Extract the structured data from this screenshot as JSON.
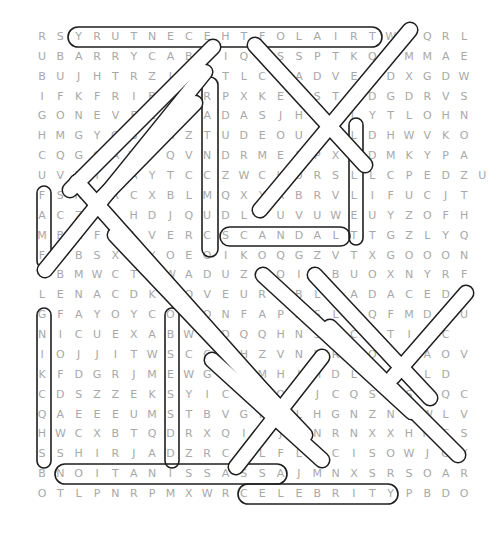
{
  "puzzle": {
    "cols": 24,
    "rows": 24,
    "origin_x": 42,
    "origin_y": 37,
    "step_x": 18.35,
    "step_y": 19.87,
    "grid": [
      "RSYRUTNECEHTFOLAIRTWBQRL",
      "UBARRYCABDIQSSSPTKQIMMAE",
      "BUJHTRZIIYTLCSADVEODXGDW",
      "IFKFRIBOERPXKEESTGDGDRVS",
      "GONEVFLHPADASJHRRLYTLOHN",
      "HMGYOBLAZTUDEOUAPLDHWVKO",
      "CQGCAWPQVNDRMEPPXADMKYPA",
      "UVHTAAYTCCZWCHURSLLCPEDZU",
      "FSNORCXBLMQXYRBRVLIFUCJT",
      "ACZALHDJQUDLFUVUWEUYZOFH",
      "MBZFLLVERCSCANDALTTGZLYQ",
      "FZBSXAYOEOIKOQGZVTXGOOON",
      "IBMWCTNWADUZNOITBUOXNYRF",
      "LENACDKOOVEUREBLSADACEDC",
      "GFAYOYCOIONFAPWSLAQFMDRU",
      "NICUEXABWTDQQHNSLCATIJC",
      "IOJJITWSCCAHZVNBRRODMAOV",
      "KFDGRJMEWGISMHIHDLAOHLD",
      "CDSZZEKSYICENOYJCQSTSPQC",
      "QAEEEUMSTBVGPELHGNZNSWLV",
      "HWCXBTQDRXQIRJSNRNXXHMCS",
      "SSHIRJADZRCPLFLTCISOWJOY",
      "BNOITANISSASSAJMNXSRSOAR",
      "OTLPNRPMXWRCELEBRITYPBDO"
    ],
    "found_words": [
      {
        "word": "YRUTNECEHTFOLAIRT",
        "from": [
          0,
          2
        ],
        "to": [
          0,
          18
        ]
      },
      {
        "word": "CELEBRITY",
        "from": [
          23,
          11
        ],
        "to": [
          23,
          19
        ]
      },
      {
        "word": "NOITANISSASSA",
        "from": [
          22,
          1
        ],
        "to": [
          22,
          13
        ]
      },
      {
        "word": "SCANDAL",
        "from": [
          10,
          10
        ],
        "to": [
          10,
          16
        ]
      },
      {
        "word": "YRATNUCM",
        "from": [
          2,
          9
        ],
        "to": [
          9,
          9
        ]
      },
      {
        "word": "ALLET",
        "from": [
          6,
          17
        ],
        "to": [
          10,
          17
        ]
      },
      {
        "word": "FACMI",
        "from": [
          8,
          1
        ],
        "to": [
          12,
          1
        ]
      },
      {
        "word": "GNIKHQS",
        "from": [
          14,
          1
        ],
        "to": [
          21,
          1
        ]
      },
      {
        "word": "OBSESSED",
        "from": [
          14,
          8
        ],
        "to": [
          21,
          8
        ]
      }
    ]
  },
  "highlight_color": "#222222",
  "letter_color": "#a8a8a8"
}
